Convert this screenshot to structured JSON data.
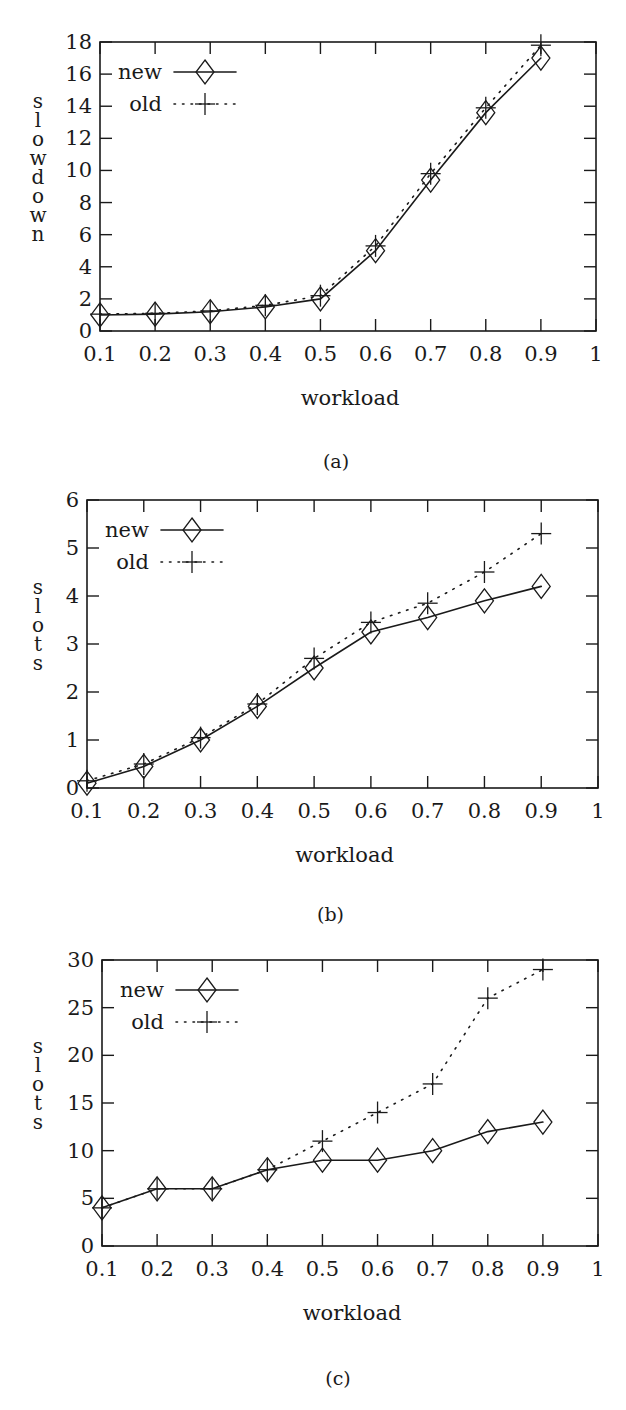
{
  "figure": {
    "panels": [
      {
        "id": "a",
        "caption": "(a)"
      },
      {
        "id": "b",
        "caption": "(b)"
      },
      {
        "id": "c",
        "caption": "(c)"
      }
    ]
  },
  "chart_data": [
    {
      "type": "line",
      "caption": "(a)",
      "title": "",
      "xlabel": "workload",
      "ylabel": "slowdown",
      "x": [
        0.1,
        0.2,
        0.3,
        0.4,
        0.5,
        0.6,
        0.7,
        0.8,
        0.9
      ],
      "xlim": [
        0.1,
        1
      ],
      "ylim": [
        0,
        18
      ],
      "xticks": [
        "0.1",
        "0.2",
        "0.3",
        "0.4",
        "0.5",
        "0.6",
        "0.7",
        "0.8",
        "0.9",
        "1"
      ],
      "yticks": [
        "0",
        "2",
        "4",
        "6",
        "8",
        "10",
        "12",
        "14",
        "16",
        "18"
      ],
      "grid": false,
      "legend_position": "upper left",
      "series": [
        {
          "name": "new",
          "style": "solid",
          "marker": "diamond",
          "values": [
            1.0,
            1.05,
            1.2,
            1.5,
            2.0,
            5.0,
            9.4,
            13.6,
            17.0
          ]
        },
        {
          "name": "old",
          "style": "dotted",
          "marker": "plus",
          "values": [
            1.05,
            1.1,
            1.25,
            1.6,
            2.2,
            5.3,
            9.8,
            13.9,
            17.8
          ]
        }
      ]
    },
    {
      "type": "line",
      "caption": "(b)",
      "title": "",
      "xlabel": "workload",
      "ylabel": "slots",
      "x": [
        0.1,
        0.2,
        0.3,
        0.4,
        0.5,
        0.6,
        0.7,
        0.8,
        0.9
      ],
      "xlim": [
        0.1,
        1
      ],
      "ylim": [
        0,
        6
      ],
      "xticks": [
        "0.1",
        "0.2",
        "0.3",
        "0.4",
        "0.5",
        "0.6",
        "0.7",
        "0.8",
        "0.9",
        "1"
      ],
      "yticks": [
        "0",
        "1",
        "2",
        "3",
        "4",
        "5",
        "6"
      ],
      "grid": false,
      "legend_position": "upper left",
      "series": [
        {
          "name": "new",
          "style": "solid",
          "marker": "diamond",
          "values": [
            0.1,
            0.45,
            1.0,
            1.7,
            2.5,
            3.25,
            3.55,
            3.9,
            4.2
          ]
        },
        {
          "name": "old",
          "style": "dotted",
          "marker": "plus",
          "values": [
            0.15,
            0.5,
            1.05,
            1.75,
            2.7,
            3.45,
            3.85,
            4.5,
            5.3
          ]
        }
      ]
    },
    {
      "type": "line",
      "caption": "(c)",
      "title": "",
      "xlabel": "workload",
      "ylabel": "slots",
      "x": [
        0.1,
        0.2,
        0.3,
        0.4,
        0.5,
        0.6,
        0.7,
        0.8,
        0.9
      ],
      "xlim": [
        0.1,
        1
      ],
      "ylim": [
        0,
        30
      ],
      "xticks": [
        "0.1",
        "0.2",
        "0.3",
        "0.4",
        "0.5",
        "0.6",
        "0.7",
        "0.8",
        "0.9",
        "1"
      ],
      "yticks": [
        "0",
        "5",
        "10",
        "15",
        "20",
        "25",
        "30"
      ],
      "grid": false,
      "legend_position": "upper left",
      "series": [
        {
          "name": "new",
          "style": "solid",
          "marker": "diamond",
          "values": [
            4,
            6,
            6,
            8,
            9,
            9,
            10,
            12,
            13
          ]
        },
        {
          "name": "old",
          "style": "dotted",
          "marker": "plus",
          "values": [
            4,
            6,
            6,
            8,
            11,
            14,
            17,
            26,
            29
          ]
        }
      ]
    }
  ]
}
